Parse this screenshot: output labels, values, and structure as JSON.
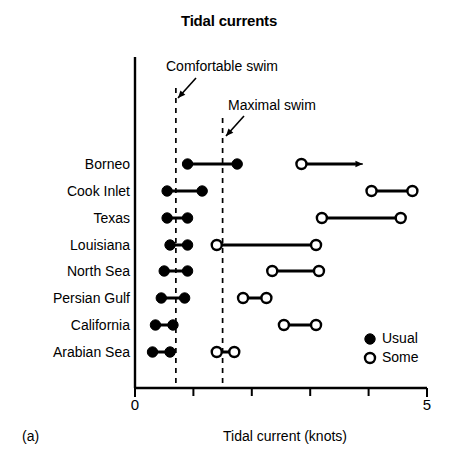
{
  "figure": {
    "panel_caption": "(a)",
    "title": "Tidal currents",
    "xlabel": "Tidal current (knots)"
  },
  "annotations": {
    "comfortable": "Comfortable swim",
    "maximal": "Maximal swim"
  },
  "legend": {
    "usual": "Usual",
    "some": "Some"
  },
  "axis": {
    "ticks": [
      "0",
      "5"
    ],
    "tick_values": [
      0,
      1,
      2,
      3,
      4,
      5
    ],
    "labeled_ticks": [
      0,
      5
    ]
  },
  "colors": {
    "ink": "#000000",
    "background": "#ffffff"
  },
  "chart_data": {
    "type": "scatter",
    "title": "Tidal currents",
    "xlabel": "Tidal current (knots)",
    "ylabel": "",
    "xlim": [
      0,
      5
    ],
    "grid": false,
    "legend_position": "inside-bottom-right",
    "legend": [
      {
        "name": "Usual",
        "marker": "filled-circle"
      },
      {
        "name": "Some",
        "marker": "open-circle"
      }
    ],
    "reference_lines": [
      {
        "label": "Comfortable swim",
        "value": 0.7,
        "style": "dashed"
      },
      {
        "label": "Maximal swim",
        "value": 1.5,
        "style": "dashed"
      }
    ],
    "categories": [
      "Borneo",
      "Cook Inlet",
      "Texas",
      "Louisiana",
      "North Sea",
      "Persian Gulf",
      "California",
      "Arabian Sea"
    ],
    "series": [
      {
        "name": "Usual",
        "marker": "filled-circle",
        "ranges": [
          {
            "category": "Borneo",
            "low": 0.9,
            "high": 1.75
          },
          {
            "category": "Cook Inlet",
            "low": 0.55,
            "high": 1.15
          },
          {
            "category": "Texas",
            "low": 0.55,
            "high": 0.9
          },
          {
            "category": "Louisiana",
            "low": 0.6,
            "high": 0.9
          },
          {
            "category": "North Sea",
            "low": 0.5,
            "high": 0.9
          },
          {
            "category": "Persian Gulf",
            "low": 0.45,
            "high": 0.85
          },
          {
            "category": "California",
            "low": 0.35,
            "high": 0.65
          },
          {
            "category": "Arabian Sea",
            "low": 0.3,
            "high": 0.6
          }
        ]
      },
      {
        "name": "Some",
        "marker": "open-circle",
        "ranges": [
          {
            "category": "Borneo",
            "low": 2.85,
            "high": 3.9,
            "open_ended": true
          },
          {
            "category": "Cook Inlet",
            "low": 4.05,
            "high": 4.75
          },
          {
            "category": "Texas",
            "low": 3.2,
            "high": 4.55
          },
          {
            "category": "Louisiana",
            "low": 1.4,
            "high": 3.1
          },
          {
            "category": "North Sea",
            "low": 2.35,
            "high": 3.15
          },
          {
            "category": "Persian Gulf",
            "low": 1.85,
            "high": 2.25
          },
          {
            "category": "California",
            "low": 2.55,
            "high": 3.1
          },
          {
            "category": "Arabian Sea",
            "low": 1.4,
            "high": 1.7
          }
        ]
      }
    ]
  }
}
